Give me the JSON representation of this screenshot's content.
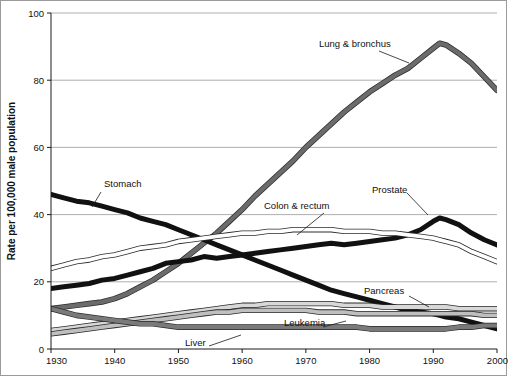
{
  "chart_data": {
    "type": "line",
    "title": "",
    "subtitle": "",
    "xlabel": "",
    "ylabel": "Rate per 100,000 male population",
    "xlim": [
      1930,
      2000
    ],
    "ylim": [
      0,
      100
    ],
    "grid": true,
    "legend_position": "inline-annotations",
    "y_ticks": [
      0,
      20,
      40,
      60,
      80,
      100
    ],
    "x_ticks": [
      1930,
      1940,
      1950,
      1960,
      1970,
      1980,
      1990,
      2000
    ],
    "x": [
      1930,
      1932,
      1934,
      1936,
      1938,
      1940,
      1942,
      1944,
      1946,
      1948,
      1950,
      1952,
      1954,
      1956,
      1958,
      1960,
      1962,
      1964,
      1966,
      1968,
      1970,
      1972,
      1974,
      1976,
      1978,
      1980,
      1982,
      1984,
      1986,
      1988,
      1990,
      1991,
      1992,
      1994,
      1996,
      1998,
      2000
    ],
    "series": [
      {
        "name": "Lung & bronchus",
        "style": "thick-gray",
        "color": "#6b6b6b",
        "values": [
          12,
          12.5,
          13,
          13.5,
          14,
          15,
          16.5,
          18.5,
          20.5,
          23,
          25.5,
          28.5,
          31.5,
          34.5,
          38,
          41.5,
          45.5,
          49,
          52.5,
          56,
          60,
          63.5,
          67,
          70.5,
          73.5,
          76.5,
          79,
          81.5,
          83.5,
          86.5,
          89.5,
          91,
          90.5,
          88,
          85,
          81,
          77
        ]
      },
      {
        "name": "Stomach",
        "style": "thick-black",
        "color": "#111111",
        "values": [
          46,
          45,
          44,
          43.5,
          42.5,
          41.5,
          40.5,
          39,
          38,
          37,
          35.5,
          34,
          32.5,
          31,
          29.5,
          28,
          26.5,
          25,
          23.5,
          22,
          20.5,
          19,
          17.5,
          16.5,
          15.5,
          14.5,
          13.5,
          12.5,
          11.5,
          11,
          10.5,
          10,
          9.5,
          9,
          8,
          7,
          6
        ]
      },
      {
        "name": "Prostate",
        "style": "thick-black",
        "color": "#111111",
        "values": [
          18,
          18.5,
          19,
          19.5,
          20.5,
          21,
          22,
          23,
          24,
          25.5,
          26,
          26.5,
          27.5,
          27,
          27.5,
          28,
          28.5,
          29,
          29.5,
          30,
          30.5,
          31,
          31.5,
          31,
          31.5,
          32,
          32.5,
          33,
          34,
          35.5,
          38,
          39,
          38.5,
          37,
          34.5,
          32.5,
          31
        ]
      },
      {
        "name": "Colon & rectum",
        "style": "outline-white",
        "color": "#ffffff",
        "values": [
          24,
          25,
          26,
          26.5,
          27.5,
          28,
          29,
          30,
          30.5,
          31,
          32,
          32.5,
          33,
          33.5,
          34,
          34.5,
          34.5,
          35,
          35,
          35.5,
          35.5,
          35.5,
          35.5,
          35,
          35,
          35,
          34.5,
          34.5,
          34,
          33.5,
          33,
          32.5,
          32,
          31,
          29,
          27.5,
          26
        ]
      },
      {
        "name": "Pancreas",
        "style": "outline-light",
        "color": "#d8d8d8",
        "values": [
          5.5,
          6,
          6.5,
          7,
          7.5,
          8,
          8.5,
          9,
          9.5,
          10,
          10.5,
          11,
          11.5,
          12,
          12.5,
          13,
          13,
          13.5,
          13.5,
          13.5,
          13.5,
          13.5,
          13.5,
          13,
          13,
          13,
          12.5,
          12.5,
          12.5,
          12.5,
          12.5,
          12.5,
          12.5,
          12,
          12,
          12,
          12
        ]
      },
      {
        "name": "Leukemia",
        "style": "outline-mid",
        "color": "#bfbfbf",
        "values": [
          4.5,
          5,
          5.5,
          6,
          6.5,
          7,
          7.5,
          8,
          8.5,
          9,
          9.5,
          10,
          10.5,
          11,
          11,
          11.5,
          11.5,
          11.5,
          11.5,
          11.5,
          11.5,
          11,
          11,
          11,
          10.5,
          10.5,
          10.5,
          10.5,
          10.5,
          10.5,
          10.5,
          10.5,
          10.5,
          10.5,
          10.5,
          10,
          10
        ]
      },
      {
        "name": "Liver",
        "style": "thick-gray",
        "color": "#7a7a7a",
        "values": [
          12,
          11,
          10,
          9.5,
          9,
          8.5,
          8,
          7.5,
          7.5,
          7,
          6.5,
          6.5,
          6.5,
          6.5,
          6.5,
          6.5,
          6.5,
          6.5,
          6.5,
          6.5,
          6.5,
          6.5,
          6.5,
          6.5,
          6.5,
          6,
          6,
          6,
          6,
          6,
          6,
          6,
          6,
          6.5,
          6.5,
          7,
          7
        ]
      }
    ],
    "annotations": [
      {
        "label": "Lung & bronchus",
        "x": 318,
        "y": 46
      },
      {
        "label": "Stomach",
        "x": 103,
        "y": 186
      },
      {
        "label": "Colon & rectum",
        "x": 263,
        "y": 208
      },
      {
        "label": "Prostate",
        "x": 371,
        "y": 192
      },
      {
        "label": "Pancreas",
        "x": 363,
        "y": 293
      },
      {
        "label": "Leukemia",
        "x": 283,
        "y": 325
      },
      {
        "label": "Liver",
        "x": 184,
        "y": 345
      }
    ]
  }
}
